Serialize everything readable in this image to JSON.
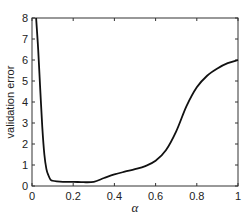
{
  "chart_data": {
    "type": "line",
    "title": "",
    "xlabel": "α",
    "ylabel": "validation error",
    "xlim": [
      0,
      1
    ],
    "ylim": [
      0,
      8
    ],
    "grid": false,
    "legend": null,
    "x_ticks": [
      "0",
      "0.2",
      "0.4",
      "0.6",
      "0.8",
      "1"
    ],
    "y_ticks": [
      "0",
      "1",
      "2",
      "3",
      "4",
      "5",
      "6",
      "7",
      "8"
    ],
    "series": [
      {
        "name": "validation error",
        "color": "#111111",
        "x": [
          0.02,
          0.03,
          0.04,
          0.05,
          0.06,
          0.07,
          0.08,
          0.09,
          0.1,
          0.12,
          0.15,
          0.2,
          0.25,
          0.3,
          0.35,
          0.4,
          0.45,
          0.5,
          0.55,
          0.6,
          0.65,
          0.7,
          0.75,
          0.8,
          0.85,
          0.9,
          0.95,
          1.0
        ],
        "values": [
          8.0,
          6.5,
          4.6,
          2.8,
          1.5,
          0.8,
          0.5,
          0.3,
          0.25,
          0.22,
          0.2,
          0.2,
          0.18,
          0.2,
          0.38,
          0.55,
          0.68,
          0.8,
          0.95,
          1.2,
          1.7,
          2.6,
          3.8,
          4.7,
          5.25,
          5.6,
          5.85,
          6.0
        ]
      }
    ]
  }
}
